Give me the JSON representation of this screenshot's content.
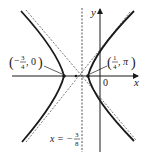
{
  "diagram": {
    "type": "hyperbola-graph",
    "axes": {
      "x_label": "x",
      "y_label": "y",
      "origin_label": "0"
    },
    "vertices": [
      {
        "name": "left-vertex",
        "label_open": "(",
        "num": "3",
        "den": "4",
        "sign": "−",
        "rest": ", 0",
        "label_close": ")",
        "x": -0.75,
        "y": 0
      },
      {
        "name": "right-vertex",
        "label_open": "(",
        "num": "1",
        "den": "4",
        "sign": "",
        "rest": ", π",
        "label_close": ")",
        "x": 0.25,
        "y": 0
      }
    ],
    "directrix": {
      "label_prefix": "x = −",
      "num": "3",
      "den": "8",
      "value": -0.375
    },
    "colors": {
      "curve": "#1a1a1a",
      "axes": "#1a1a1a",
      "dashed": "#555555"
    }
  }
}
